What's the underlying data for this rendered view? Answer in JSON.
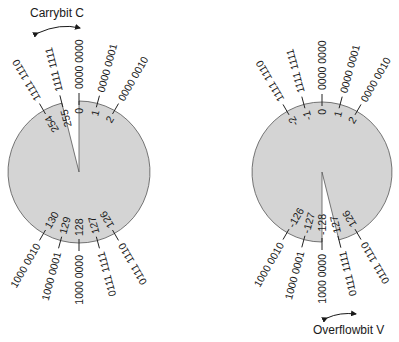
{
  "colors": {
    "disc_fill": "#d4d4d4",
    "disc_stroke": "#555555",
    "text": "#1a1a1a"
  },
  "left_wheel": {
    "title": "Carrybit C",
    "center": [
      79,
      172
    ],
    "radius": 71,
    "gap_between": [
      "255",
      "0"
    ],
    "ticks": [
      {
        "angle": -30,
        "binary": "1111 1110",
        "value": "254"
      },
      {
        "angle": -14,
        "binary": "1111 1111",
        "value": "255"
      },
      {
        "angle": 0,
        "binary": "0000 0000",
        "value": "0"
      },
      {
        "angle": 15,
        "binary": "0000 0001",
        "value": "1"
      },
      {
        "angle": 30,
        "binary": "0000 0010",
        "value": "2"
      },
      {
        "angle": 150,
        "binary": "0111 1110",
        "value": "126"
      },
      {
        "angle": 165,
        "binary": "0111 1111",
        "value": "127"
      },
      {
        "angle": 180,
        "binary": "1000 0000",
        "value": "128"
      },
      {
        "angle": 195,
        "binary": "1000 0001",
        "value": "129"
      },
      {
        "angle": 210,
        "binary": "1000 0010",
        "value": "130"
      }
    ]
  },
  "right_wheel": {
    "title": "Overflowbit V",
    "center": [
      322,
      172
    ],
    "radius": 70,
    "gap_between": [
      "127",
      "-128"
    ],
    "ticks": [
      {
        "angle": -30,
        "binary": "1111 1110",
        "value": "-2"
      },
      {
        "angle": -15,
        "binary": "1111 1111",
        "value": "-1"
      },
      {
        "angle": 0,
        "binary": "0000 0000",
        "value": "0"
      },
      {
        "angle": 15,
        "binary": "0000 0001",
        "value": "1"
      },
      {
        "angle": 30,
        "binary": "0000 0010",
        "value": "2"
      },
      {
        "angle": 150,
        "binary": "0111 1110",
        "value": "126"
      },
      {
        "angle": 166,
        "binary": "0111 1111",
        "value": "127"
      },
      {
        "angle": 180,
        "binary": "1000 0000",
        "value": "-128"
      },
      {
        "angle": 195,
        "binary": "1000 0001",
        "value": "-127"
      },
      {
        "angle": 210,
        "binary": "1000 0010",
        "value": "-126"
      }
    ]
  }
}
